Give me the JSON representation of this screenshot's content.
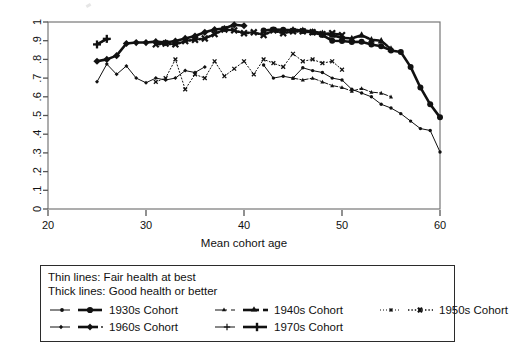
{
  "chart_data": {
    "type": "line",
    "title": "",
    "xlabel": "Mean cohort age",
    "ylabel": "",
    "xlim": [
      20,
      60
    ],
    "ylim": [
      0,
      1
    ],
    "xticks": [
      20,
      30,
      40,
      50,
      60
    ],
    "xtick_labels": [
      "20",
      "30",
      "40",
      "50",
      "60"
    ],
    "yticks": [
      0,
      0.1,
      0.2,
      0.3,
      0.4,
      0.5,
      0.6,
      0.7,
      0.8,
      0.9,
      1
    ],
    "ytick_labels": [
      "0",
      ".1",
      ".2",
      ".3",
      ".4",
      ".5",
      ".6",
      ".7",
      ".8",
      ".9",
      "1"
    ],
    "grid": false,
    "legend_position": "below-plot",
    "series": [
      {
        "name": "1930s Cohort — Good health or better",
        "cohort": "1930s",
        "health": "Good health or better",
        "weight": "thick",
        "marker": "circle",
        "dash": "solid",
        "x": [
          42.0,
          43.0,
          44.0,
          45.0,
          46.0,
          47.0,
          48.0,
          49.0,
          50.0,
          51.0,
          52.0,
          53.0,
          54.0,
          55.0,
          56.0,
          57.0,
          58.0,
          59.0,
          60.0
        ],
        "y": [
          0.955,
          0.96,
          0.958,
          0.955,
          0.952,
          0.945,
          0.93,
          0.9,
          0.898,
          0.893,
          0.894,
          0.88,
          0.87,
          0.848,
          0.84,
          0.76,
          0.65,
          0.56,
          0.49
        ]
      },
      {
        "name": "1930s Cohort — Fair health at best",
        "cohort": "1930s",
        "health": "Fair health at best",
        "weight": "thin",
        "marker": "circle",
        "dash": "solid",
        "x": [
          42.0,
          43.0,
          44.0,
          45.0,
          46.0,
          47.0,
          48.0,
          49.0,
          50.0,
          51.0,
          52.0,
          53.0,
          54.0,
          55.0,
          56.0,
          57.0,
          58.0,
          59.0,
          60.0
        ],
        "y": [
          0.77,
          0.7,
          0.71,
          0.7,
          0.755,
          0.74,
          0.73,
          0.7,
          0.69,
          0.64,
          0.62,
          0.6,
          0.56,
          0.54,
          0.51,
          0.47,
          0.43,
          0.42,
          0.305
        ]
      },
      {
        "name": "1940s Cohort — Good health or better",
        "cohort": "1940s",
        "health": "Good health or better",
        "weight": "thick",
        "marker": "triangle",
        "dash": "dashdot",
        "x": [
          45.0,
          46.0,
          47.0,
          48.0,
          49.0,
          50.0,
          51.0,
          52.0,
          53.0,
          54.0,
          55.0
        ],
        "y": [
          0.958,
          0.955,
          0.948,
          0.94,
          0.93,
          0.915,
          0.912,
          0.93,
          0.905,
          0.9,
          0.855
        ]
      },
      {
        "name": "1940s Cohort — Fair health at best",
        "cohort": "1940s",
        "health": "Fair health at best",
        "weight": "thin",
        "marker": "triangle",
        "dash": "dashdot",
        "x": [
          45.0,
          46.0,
          47.0,
          48.0,
          49.0,
          50.0,
          51.0,
          52.0,
          53.0,
          54.0,
          55.0
        ],
        "y": [
          0.7,
          0.69,
          0.7,
          0.68,
          0.66,
          0.65,
          0.63,
          0.645,
          0.625,
          0.62,
          0.6
        ]
      },
      {
        "name": "1950s Cohort — Good health or better",
        "cohort": "1950s",
        "health": "Good health or better",
        "weight": "thick",
        "marker": "x",
        "dash": "dotted",
        "x": [
          31.0,
          32.0,
          33.0,
          34.0,
          35.0,
          36.0,
          37.0,
          38.0,
          39.0,
          40.0,
          41.0,
          42.0,
          43.0,
          44.0,
          45.0,
          46.0,
          47.0,
          48.0,
          49.0,
          50.0
        ],
        "y": [
          0.88,
          0.885,
          0.88,
          0.898,
          0.905,
          0.912,
          0.935,
          0.96,
          0.955,
          0.94,
          0.945,
          0.93,
          0.955,
          0.94,
          0.95,
          0.95,
          0.945,
          0.935,
          0.94,
          0.93
        ]
      },
      {
        "name": "1950s Cohort — Fair health at best",
        "cohort": "1950s",
        "health": "Fair health at best",
        "weight": "thin",
        "marker": "x",
        "dash": "dotted",
        "x": [
          31.0,
          32.0,
          33.0,
          34.0,
          35.0,
          36.0,
          37.0,
          38.0,
          39.0,
          40.0,
          41.0,
          42.0,
          43.0,
          44.0,
          45.0,
          46.0,
          47.0,
          48.0,
          49.0,
          50.0
        ],
        "y": [
          0.68,
          0.7,
          0.8,
          0.64,
          0.72,
          0.7,
          0.79,
          0.71,
          0.75,
          0.79,
          0.72,
          0.8,
          0.78,
          0.76,
          0.83,
          0.79,
          0.8,
          0.78,
          0.79,
          0.745
        ]
      },
      {
        "name": "1960s Cohort — Good health or better",
        "cohort": "1960s",
        "health": "Good health or better",
        "weight": "thick",
        "marker": "diamond",
        "dash": "solid",
        "x": [
          25.0,
          26.0,
          27.0,
          28.0,
          29.0,
          30.0,
          31.0,
          32.0,
          33.0,
          34.0,
          35.0,
          36.0,
          37.0,
          38.0,
          39.0,
          40.0
        ],
        "y": [
          0.79,
          0.8,
          0.82,
          0.885,
          0.89,
          0.89,
          0.895,
          0.89,
          0.898,
          0.912,
          0.925,
          0.945,
          0.96,
          0.965,
          0.985,
          0.98
        ]
      },
      {
        "name": "1960s Cohort — Fair health at best",
        "cohort": "1960s",
        "health": "Fair health at best",
        "weight": "thin",
        "marker": "diamond",
        "dash": "solid",
        "x": [
          25.0,
          26.0,
          27.0,
          28.0,
          29.0,
          30.0,
          31.0,
          32.0,
          33.0,
          34.0,
          35.0,
          36.0
        ],
        "y": [
          0.68,
          0.775,
          0.72,
          0.765,
          0.7,
          0.675,
          0.7,
          0.69,
          0.7,
          0.74,
          0.73,
          0.76
        ]
      },
      {
        "name": "1970s Cohort — Good health or better",
        "cohort": "1970s",
        "health": "Good health or better",
        "weight": "thick",
        "marker": "plus",
        "dash": "solid",
        "x": [
          25.0,
          26.0
        ],
        "y": [
          0.88,
          0.91
        ]
      },
      {
        "name": "1970s Cohort — Fair health at best",
        "cohort": "1970s",
        "health": "Fair health at best",
        "weight": "thin",
        "marker": "plus",
        "dash": "solid",
        "x": [
          25.0,
          26.0
        ],
        "y": [
          0.88,
          0.905
        ]
      }
    ]
  },
  "legend": {
    "note_thin": "Thin lines: Fair health at best",
    "note_thick": "Thick lines: Good health or better",
    "entries": [
      {
        "label": "1930s Cohort",
        "marker": "circle",
        "dash": "solid"
      },
      {
        "label": "1940s Cohort",
        "marker": "triangle",
        "dash": "dashdot"
      },
      {
        "label": "1950s Cohort",
        "marker": "x",
        "dash": "dotted"
      },
      {
        "label": "1960s Cohort",
        "marker": "diamond",
        "dash": "solid"
      },
      {
        "label": "1970s Cohort",
        "marker": "plus",
        "dash": "solid"
      }
    ]
  },
  "colors": {
    "ink": "#111111",
    "axis": "#555555",
    "background": "#ffffff"
  }
}
